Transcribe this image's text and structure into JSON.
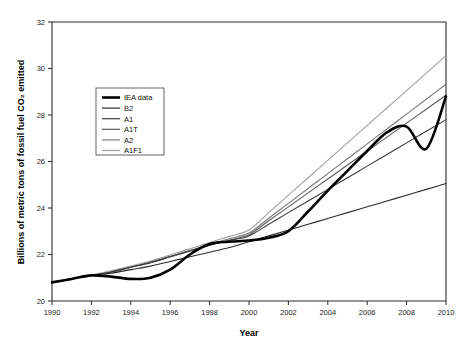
{
  "chart_data": {
    "type": "line",
    "title": "",
    "xlabel": "Year",
    "ylabel": "Billions of metric tons of fossil fuel CO₂ emitted",
    "xlim": [
      1990,
      2010
    ],
    "ylim": [
      20,
      32
    ],
    "xticks": [
      1990,
      1992,
      1994,
      1996,
      1998,
      2000,
      2002,
      2004,
      2006,
      2008,
      2010
    ],
    "yticks": [
      20,
      22,
      24,
      26,
      28,
      30,
      32
    ],
    "xtick_labels": [
      "1990",
      "1992",
      "1994",
      "1996",
      "1998",
      "2000",
      "2002",
      "2004",
      "2006",
      "2008",
      "2010"
    ],
    "ytick_labels": [
      "20",
      "22",
      "24",
      "26",
      "28",
      "30",
      "32"
    ],
    "grid": false,
    "legend_position": "upper left",
    "x": [
      1990,
      1991,
      1992,
      1993,
      1994,
      1995,
      1996,
      1997,
      1998,
      1999,
      2000,
      2001,
      2002,
      2003,
      2004,
      2005,
      2006,
      2007,
      2008,
      2009,
      2010
    ],
    "series": [
      {
        "name": "IEA data",
        "color": "#000000",
        "width": 2.6,
        "values": [
          20.8,
          20.95,
          21.1,
          21.05,
          20.95,
          21.0,
          21.35,
          22.0,
          22.45,
          22.55,
          22.6,
          22.72,
          23.0,
          23.85,
          24.75,
          25.6,
          26.45,
          27.25,
          27.5,
          26.55,
          28.8
        ]
      },
      {
        "name": "B2",
        "color": "#2a2a2a",
        "width": 1.1,
        "values": [
          20.8,
          20.95,
          21.1,
          21.2,
          21.35,
          21.5,
          21.7,
          21.9,
          22.1,
          22.3,
          22.55,
          22.8,
          23.05,
          23.3,
          23.55,
          23.8,
          24.05,
          24.3,
          24.55,
          24.8,
          25.05
        ]
      },
      {
        "name": "A1",
        "color": "#3d3d3d",
        "width": 1.1,
        "values": [
          20.8,
          20.95,
          21.1,
          21.25,
          21.45,
          21.65,
          21.9,
          22.15,
          22.4,
          22.6,
          22.8,
          23.3,
          23.8,
          24.3,
          24.8,
          25.3,
          25.8,
          26.3,
          26.8,
          27.3,
          27.8
        ]
      },
      {
        "name": "A1T",
        "color": "#5a5a5a",
        "width": 1.1,
        "values": [
          20.8,
          20.95,
          21.1,
          21.25,
          21.45,
          21.65,
          21.9,
          22.15,
          22.4,
          22.62,
          22.85,
          23.45,
          24.05,
          24.65,
          25.25,
          25.85,
          26.45,
          27.05,
          27.65,
          28.25,
          28.85
        ]
      },
      {
        "name": "A2",
        "color": "#777777",
        "width": 1.1,
        "values": [
          20.8,
          20.95,
          21.1,
          21.25,
          21.45,
          21.68,
          21.92,
          22.18,
          22.44,
          22.68,
          22.92,
          23.56,
          24.2,
          24.84,
          25.48,
          26.12,
          26.76,
          27.4,
          28.04,
          28.68,
          29.32
        ]
      },
      {
        "name": "A1F1",
        "color": "#a0a0a0",
        "width": 1.1,
        "values": [
          20.8,
          20.95,
          21.12,
          21.3,
          21.5,
          21.72,
          21.98,
          22.25,
          22.52,
          22.78,
          23.05,
          23.8,
          24.55,
          25.3,
          26.05,
          26.8,
          27.55,
          28.3,
          29.05,
          29.8,
          30.55
        ]
      }
    ]
  },
  "legend": {
    "entries": [
      {
        "label": "IEA data"
      },
      {
        "label": "B2"
      },
      {
        "label": "A1"
      },
      {
        "label": "A1T"
      },
      {
        "label": "A2"
      },
      {
        "label": "A1F1"
      }
    ]
  }
}
